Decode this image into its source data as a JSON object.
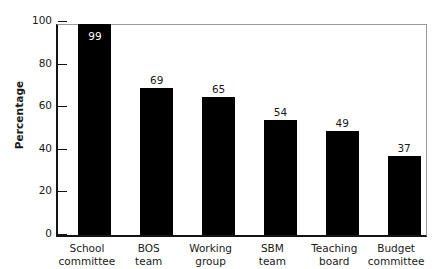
{
  "chart_data": {
    "type": "bar",
    "title": "",
    "subtitle": "",
    "xlabel": "",
    "ylabel": "Percentage",
    "ylim": [
      0,
      100
    ],
    "yticks": [
      0,
      20,
      40,
      60,
      80,
      100
    ],
    "ytick_labels": [
      "0",
      "20",
      "40",
      "60",
      "80",
      "100"
    ],
    "grid": false,
    "legend": null,
    "bar_color": "#000000",
    "categories": [
      "School committee",
      "BOS team",
      "Working group",
      "SBM team",
      "Teaching board",
      "Budget committee"
    ],
    "category_lines": [
      [
        "School",
        "committee"
      ],
      [
        "BOS",
        "team"
      ],
      [
        "Working",
        "group"
      ],
      [
        "SBM",
        "team"
      ],
      [
        "Teaching",
        "board"
      ],
      [
        "Budget",
        "committee"
      ]
    ],
    "values": [
      99,
      69,
      65,
      54,
      49,
      37
    ],
    "value_labels": [
      "99",
      "69",
      "65",
      "54",
      "49",
      "37"
    ],
    "value_label_placement": [
      "inside",
      "above",
      "above",
      "above",
      "above",
      "above"
    ]
  },
  "axes": {
    "y_title": "Percentage",
    "y_tick_labels": [
      "100",
      "80",
      "60",
      "40",
      "20",
      "0"
    ],
    "y_tick_values": [
      100,
      80,
      60,
      40,
      20,
      0
    ]
  },
  "colors": {
    "bar": "#000000",
    "axis": "#141414",
    "frame": "#9a9a9a",
    "text": "#1a1a1a",
    "background": "#ffffff",
    "inside_label": "#ffffff"
  }
}
